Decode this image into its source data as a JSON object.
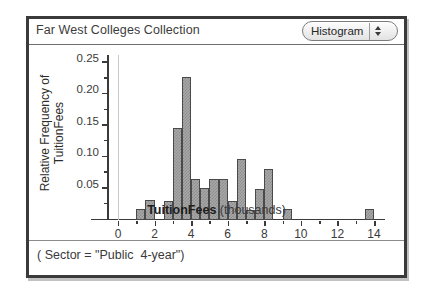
{
  "window": {
    "collection_title": "Far West Colleges Collection",
    "plot_type": "Histogram",
    "stepper_up_icon": "chevron-up-icon",
    "stepper_down_icon": "chevron-down-icon"
  },
  "footer": {
    "filter_caption": "( Sector = \"Public  4-year\")"
  },
  "chart_data": {
    "type": "bar",
    "title": "Far West Colleges Collection",
    "xlabel_bold": "TuitionFees",
    "xlabel_unit": "(thousands)",
    "ylabel_line1": "Relative Frequency of",
    "ylabel_line2": "TuitionFees",
    "xlim": [
      -0.6,
      14.6
    ],
    "ylim": [
      0,
      0.2625
    ],
    "bin_width": 0.5,
    "grid": false,
    "legend": false,
    "x_ticks": [
      0,
      2,
      4,
      6,
      8,
      10,
      12,
      14
    ],
    "x_tick_labels": [
      "0",
      "2",
      "4",
      "6",
      "8",
      "10",
      "12",
      "14"
    ],
    "x_minor_ticks": [
      1,
      3,
      5,
      7,
      9,
      11,
      13
    ],
    "y_ticks": [
      0.05,
      0.1,
      0.15,
      0.2,
      0.25
    ],
    "y_tick_labels": [
      "0.05",
      "0.10",
      "0.15",
      "0.20",
      "0.25"
    ],
    "y_minor_ticks": [
      0.025,
      0.075,
      0.125,
      0.175,
      0.225
    ],
    "bar_fill_color": "#a8a8a8",
    "bar_edge_color": "#4a4a4a",
    "bins": [
      {
        "x0": 1.0,
        "x1": 1.5,
        "value": 0.018
      },
      {
        "x0": 1.5,
        "x1": 2.0,
        "value": 0.032
      },
      {
        "x0": 2.5,
        "x1": 3.0,
        "value": 0.031
      },
      {
        "x0": 3.0,
        "x1": 3.5,
        "value": 0.146
      },
      {
        "x0": 3.5,
        "x1": 4.0,
        "value": 0.227
      },
      {
        "x0": 4.0,
        "x1": 4.5,
        "value": 0.065
      },
      {
        "x0": 4.5,
        "x1": 5.0,
        "value": 0.051
      },
      {
        "x0": 5.0,
        "x1": 5.5,
        "value": 0.065
      },
      {
        "x0": 5.5,
        "x1": 6.0,
        "value": 0.065
      },
      {
        "x0": 6.0,
        "x1": 6.5,
        "value": 0.031
      },
      {
        "x0": 6.5,
        "x1": 7.0,
        "value": 0.097
      },
      {
        "x0": 7.0,
        "x1": 7.5,
        "value": 0.016
      },
      {
        "x0": 7.5,
        "x1": 8.0,
        "value": 0.05
      },
      {
        "x0": 8.0,
        "x1": 8.5,
        "value": 0.081
      },
      {
        "x0": 9.0,
        "x1": 9.5,
        "value": 0.018
      },
      {
        "x0": 13.5,
        "x1": 14.0,
        "value": 0.018
      }
    ]
  }
}
